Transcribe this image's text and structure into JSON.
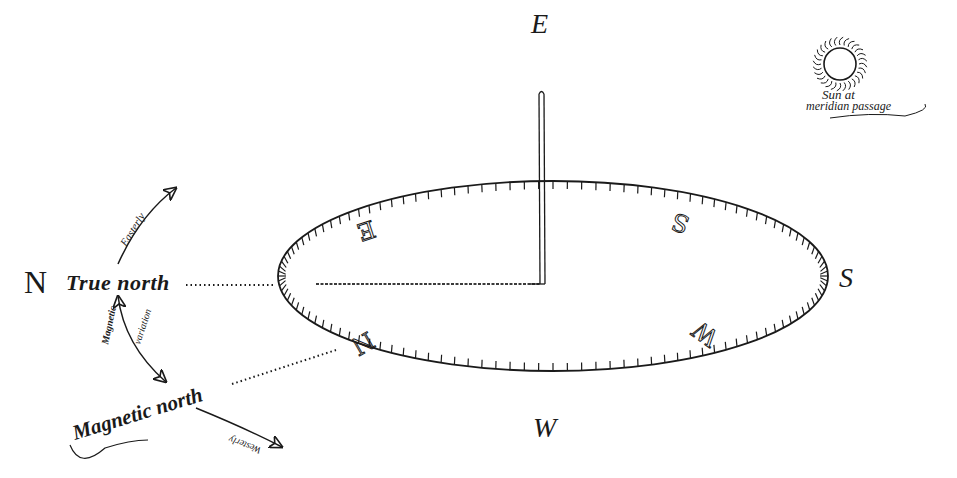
{
  "diagram": {
    "type": "sundial-compass-illustration",
    "colors": {
      "ink": "#1a1a1a",
      "background": "#ffffff"
    },
    "cardinal_labels": {
      "top": "E",
      "right": "S",
      "bottom": "W",
      "left": "N"
    },
    "dial_letters": {
      "upper_left": "E",
      "upper_right": "S",
      "lower_right": "W",
      "lower_left": "N"
    },
    "true_north_label": "True north",
    "magnetic_north_label": "Magnetic north",
    "easterly_label": "Easterly",
    "westerly_label": "Westerly",
    "magnetic_variation_label": [
      "Magnetic",
      "variation"
    ],
    "sun_label": [
      "Sun at",
      "meridian passage"
    ],
    "sun_icon": "sun-icon",
    "ellipse": {
      "cx": 553,
      "cy": 276,
      "rx": 275,
      "ry": 95,
      "tick_count": 120
    }
  }
}
